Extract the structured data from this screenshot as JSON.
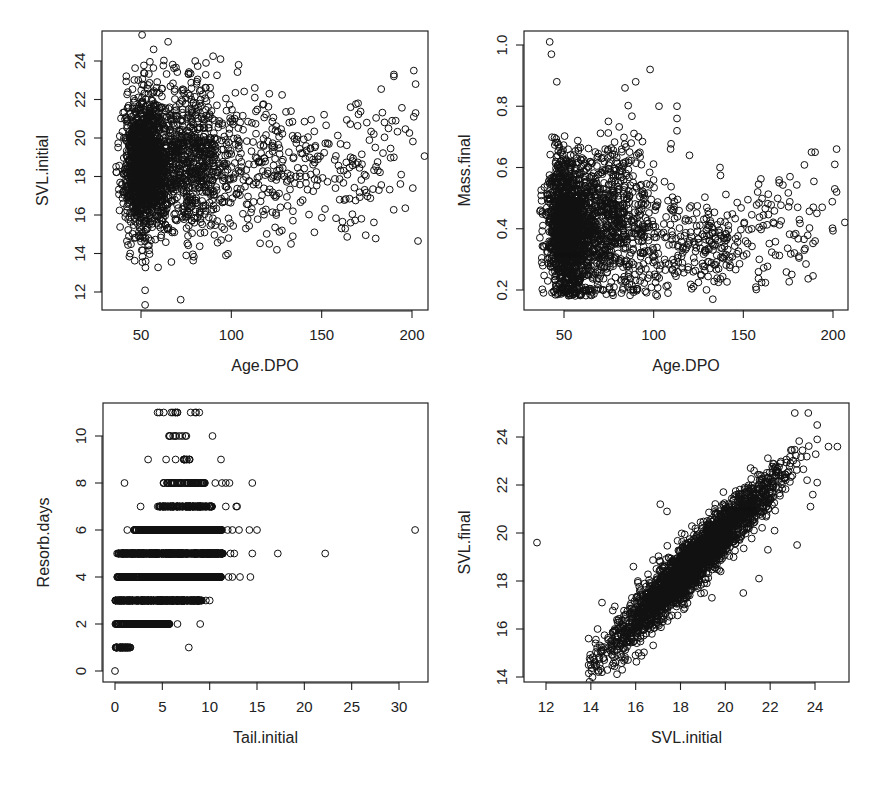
{
  "chart_data": [
    {
      "id": "p1",
      "type": "scatter",
      "title": "",
      "xlabel": "Age.DPO",
      "ylabel": "SVL.initial",
      "xticks": [
        50,
        100,
        150,
        200
      ],
      "yticks": [
        12,
        14,
        16,
        18,
        20,
        22,
        24
      ],
      "xlim": [
        30,
        208
      ],
      "ylim": [
        11.2,
        25.4
      ],
      "grid": false,
      "legend": null,
      "frame_px": {
        "left": 102,
        "top": 31,
        "right": 428,
        "bottom": 310
      },
      "axis_map_px": {
        "x": [
          [
            50,
            141
          ],
          [
            200,
            412
          ]
        ],
        "y": [
          [
            24,
            61
          ],
          [
            12,
            292
          ]
        ]
      },
      "clusters": [
        {
          "n": 1500,
          "x_mean": 50,
          "x_sd": 8,
          "x_min": 36,
          "y_mean": 18.6,
          "y_sd": 1.8
        },
        {
          "n": 700,
          "x_mean": 75,
          "x_sd": 14,
          "x_min": 36,
          "y_mean": 18.8,
          "y_sd": 1.9
        },
        {
          "n": 220,
          "x_mean": 120,
          "x_sd": 22,
          "x_min": 60,
          "y_mean": 18.3,
          "y_sd": 1.6
        },
        {
          "n": 70,
          "x_mean": 170,
          "x_sd": 18,
          "x_min": 130,
          "y_mean": 18.7,
          "y_sd": 1.7
        }
      ],
      "points": [
        [
          65,
          25.0
        ],
        [
          57,
          24.6
        ],
        [
          72,
          11.6
        ],
        [
          97,
          13.9
        ],
        [
          75,
          13.9
        ],
        [
          44,
          14.0
        ],
        [
          201,
          23.5
        ],
        [
          202,
          22.8
        ],
        [
          190,
          23.3
        ],
        [
          190,
          23.2
        ],
        [
          202,
          21.3
        ],
        [
          201,
          21.1
        ],
        [
          194,
          18.1
        ],
        [
          190,
          19.0
        ],
        [
          172,
          15.8
        ],
        [
          166,
          15.6
        ],
        [
          161,
          15.3
        ],
        [
          146,
          15.1
        ],
        [
          133,
          14.5
        ],
        [
          121,
          14.5
        ],
        [
          94,
          24.1
        ],
        [
          104,
          23.8
        ],
        [
          113,
          22.6
        ],
        [
          113,
          22.1
        ],
        [
          121,
          22.3
        ],
        [
          166,
          21.6
        ],
        [
          175,
          20.8
        ],
        [
          187,
          20.5
        ],
        [
          189,
          20.9
        ],
        [
          191,
          20.9
        ],
        [
          133,
          21.4
        ],
        [
          128,
          15.2
        ],
        [
          134,
          14.9
        ],
        [
          108,
          15.3
        ],
        [
          80,
          24.0
        ],
        [
          86,
          23.9
        ]
      ]
    },
    {
      "id": "p2",
      "type": "scatter",
      "title": "",
      "xlabel": "Age.DPO",
      "ylabel": "Mass.final",
      "xticks": [
        50,
        100,
        150,
        200
      ],
      "yticks": [
        0.2,
        0.4,
        0.6,
        0.8,
        1.0
      ],
      "xticklabels": [
        "50",
        "100",
        "150",
        "200"
      ],
      "yticklabels": [
        "0.2",
        "0.4",
        "0.6",
        "0.8",
        "1.0"
      ],
      "xlim": [
        30,
        208
      ],
      "ylim": [
        0.135,
        1.045
      ],
      "grid": false,
      "legend": null,
      "frame_px": {
        "left": 524,
        "top": 31,
        "right": 848,
        "bottom": 310
      },
      "axis_map_px": {
        "x": [
          [
            50,
            564
          ],
          [
            200,
            833
          ]
        ],
        "y": [
          [
            1.0,
            45
          ],
          [
            0.2,
            290
          ]
        ]
      },
      "clusters": [
        {
          "n": 1500,
          "x_mean": 50,
          "x_sd": 8,
          "x_min": 36,
          "y_mean": 0.4,
          "y_sd": 0.11,
          "y_min": 0.18
        },
        {
          "n": 700,
          "x_mean": 75,
          "x_sd": 14,
          "x_min": 36,
          "y_mean": 0.42,
          "y_sd": 0.13,
          "y_min": 0.18
        },
        {
          "n": 220,
          "x_mean": 120,
          "x_sd": 20,
          "x_min": 60,
          "y_mean": 0.35,
          "y_sd": 0.08,
          "y_min": 0.2
        },
        {
          "n": 70,
          "x_mean": 168,
          "x_sd": 18,
          "x_min": 130,
          "y_mean": 0.4,
          "y_sd": 0.1,
          "y_min": 0.22
        }
      ],
      "points": [
        [
          42,
          1.01
        ],
        [
          43,
          0.97
        ],
        [
          98,
          0.92
        ],
        [
          90,
          0.88
        ],
        [
          84,
          0.86
        ],
        [
          46,
          0.88
        ],
        [
          113,
          0.8
        ],
        [
          113,
          0.76
        ],
        [
          113,
          0.72
        ],
        [
          103,
          0.8
        ],
        [
          133,
          0.17
        ],
        [
          137,
          0.6
        ],
        [
          202,
          0.66
        ],
        [
          201,
          0.61
        ],
        [
          201,
          0.53
        ],
        [
          202,
          0.52
        ],
        [
          188,
          0.65
        ],
        [
          190,
          0.65
        ],
        [
          176,
          0.57
        ],
        [
          170,
          0.55
        ],
        [
          158,
          0.52
        ],
        [
          190,
          0.36
        ],
        [
          184,
          0.33
        ],
        [
          181,
          0.31
        ],
        [
          194,
          0.47
        ],
        [
          189,
          0.47
        ],
        [
          191,
          0.45
        ],
        [
          108,
          0.19
        ],
        [
          82,
          0.19
        ],
        [
          120,
          0.64
        ]
      ]
    },
    {
      "id": "p3",
      "type": "scatter",
      "title": "",
      "xlabel": "Tail.initial",
      "ylabel": "Resorb.days",
      "xticks": [
        0,
        5,
        10,
        15,
        20,
        25,
        30
      ],
      "yticks": [
        0,
        2,
        4,
        6,
        8,
        10
      ],
      "xlim": [
        -1.2,
        33.2
      ],
      "ylim": [
        -0.45,
        11.4
      ],
      "grid": false,
      "legend": null,
      "frame_px": {
        "left": 103,
        "top": 403,
        "right": 428,
        "bottom": 682
      },
      "axis_map_px": {
        "x": [
          [
            0,
            115
          ],
          [
            30,
            399
          ]
        ],
        "y": [
          [
            10,
            436
          ],
          [
            0,
            671
          ]
        ]
      },
      "rows": [
        {
          "y": 0,
          "n": 1,
          "x_min": 0,
          "x_max": 0
        },
        {
          "y": 1,
          "n": 40,
          "x_min": 0,
          "x_max": 1.7
        },
        {
          "y": 2,
          "n": 200,
          "x_min": 0,
          "x_max": 5.8
        },
        {
          "y": 3,
          "n": 400,
          "x_min": 0,
          "x_max": 9.2
        },
        {
          "y": 4,
          "n": 500,
          "x_min": 0.2,
          "x_max": 11.2
        },
        {
          "y": 5,
          "n": 600,
          "x_min": 0.2,
          "x_max": 11.4
        },
        {
          "y": 6,
          "n": 400,
          "x_min": 2,
          "x_max": 11.3
        },
        {
          "y": 7,
          "n": 150,
          "x_min": 4.4,
          "x_max": 10.3
        },
        {
          "y": 8,
          "n": 70,
          "x_min": 4.8,
          "x_max": 9.5
        },
        {
          "y": 9,
          "n": 10,
          "x_min": 7.2,
          "x_max": 7.9
        },
        {
          "y": 10,
          "n": 8,
          "x_min": 5.6,
          "x_max": 7.7
        },
        {
          "y": 11,
          "n": 8,
          "x_min": 4.4,
          "x_max": 8.9
        }
      ],
      "points": [
        [
          7.8,
          1
        ],
        [
          9.0,
          2
        ],
        [
          6.6,
          2
        ],
        [
          10.0,
          3
        ],
        [
          9.6,
          3
        ],
        [
          14.3,
          4
        ],
        [
          13.2,
          4
        ],
        [
          12.4,
          4
        ],
        [
          12.0,
          4
        ],
        [
          31.7,
          6
        ],
        [
          22.2,
          5
        ],
        [
          17.2,
          5
        ],
        [
          14.5,
          5
        ],
        [
          12.6,
          5
        ],
        [
          12.2,
          5
        ],
        [
          15.0,
          6
        ],
        [
          14.2,
          6
        ],
        [
          13.1,
          6
        ],
        [
          12.4,
          6
        ],
        [
          11.9,
          6
        ],
        [
          1.3,
          6
        ],
        [
          2.7,
          7
        ],
        [
          11.7,
          7
        ],
        [
          12.9,
          7
        ],
        [
          12.8,
          7
        ],
        [
          1.0,
          8
        ],
        [
          10.6,
          8
        ],
        [
          11.3,
          8
        ],
        [
          11.7,
          8
        ],
        [
          12.1,
          8
        ],
        [
          14.5,
          8
        ],
        [
          3.5,
          9
        ],
        [
          5.4,
          9
        ],
        [
          6.4,
          9
        ],
        [
          11.2,
          9
        ],
        [
          10.3,
          10
        ],
        [
          5.7,
          10
        ],
        [
          5.8,
          10
        ],
        [
          4.5,
          11
        ],
        [
          4.7,
          11
        ],
        [
          6.6,
          11
        ],
        [
          8.9,
          11
        ],
        [
          8.0,
          11
        ]
      ]
    },
    {
      "id": "p4",
      "type": "scatter",
      "title": "",
      "xlabel": "SVL.initial",
      "ylabel": "SVL.final",
      "xticks": [
        12,
        14,
        16,
        18,
        20,
        22,
        24
      ],
      "yticks": [
        14,
        16,
        18,
        20,
        22,
        24
      ],
      "xlim": [
        10.3,
        25.9
      ],
      "ylim": [
        13.8,
        25.1
      ],
      "grid": false,
      "legend": null,
      "frame_px": {
        "left": 524,
        "top": 403,
        "right": 849,
        "bottom": 682
      },
      "axis_map_px": {
        "x": [
          [
            12,
            546
          ],
          [
            24,
            815
          ]
        ],
        "y": [
          [
            24,
            437
          ],
          [
            14,
            677
          ]
        ]
      },
      "trend": {
        "slope": 0.93,
        "intercept": 1.5,
        "x_mean": 18.6,
        "x_sd": 1.85,
        "resid_sd": 0.55,
        "n": 2500
      },
      "points": [
        [
          11.6,
          19.6
        ],
        [
          17.1,
          21.2
        ],
        [
          17.4,
          20.9
        ],
        [
          23.2,
          19.5
        ],
        [
          21.5,
          18.1
        ],
        [
          20.8,
          17.5
        ],
        [
          19.4,
          17.3
        ],
        [
          21.9,
          19.3
        ],
        [
          22.2,
          20.1
        ],
        [
          23.8,
          21.1
        ],
        [
          23.9,
          21.6
        ],
        [
          24.1,
          22.1
        ],
        [
          24.6,
          23.6
        ],
        [
          25.0,
          23.6
        ],
        [
          23.1,
          25.0
        ],
        [
          23.7,
          25.0
        ],
        [
          24.1,
          24.5
        ],
        [
          24.1,
          23.9
        ],
        [
          14.5,
          14.2
        ],
        [
          15.4,
          14.3
        ],
        [
          13.9,
          14.5
        ],
        [
          14.0,
          14.5
        ],
        [
          13.9,
          15.6
        ],
        [
          14.5,
          17.1
        ],
        [
          14.3,
          16.0
        ],
        [
          15.9,
          18.6
        ],
        [
          16.1,
          18.0
        ]
      ]
    }
  ]
}
